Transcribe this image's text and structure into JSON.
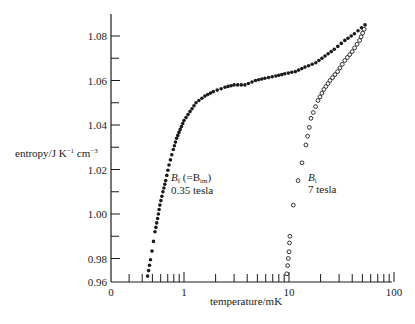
{
  "chart_data": {
    "type": "scatter",
    "title": "",
    "xlabel": "temperature/mK",
    "ylabel": "entropy/J K⁻¹ cm⁻³",
    "x_scale": "log",
    "x_ticks_major": [
      {
        "value": 0.2,
        "label": "0"
      },
      {
        "value": 1,
        "label": "1"
      },
      {
        "value": 10,
        "label": "10"
      },
      {
        "value": 100,
        "label": "100"
      }
    ],
    "x_ticks_minor": [
      0.3,
      0.4,
      0.5,
      0.6,
      0.7,
      0.8,
      0.9,
      2,
      3,
      4,
      5,
      6,
      7,
      8,
      9,
      20,
      30,
      40,
      50,
      60,
      70,
      80,
      90
    ],
    "y_ticks_major": [
      "0.96",
      "0.98",
      "1.00",
      "1.02",
      "1.04",
      "1.06",
      "1.08"
    ],
    "y_ticks_minor": [
      0.99,
      1.01,
      1.03,
      1.05,
      1.07
    ],
    "ylim": [
      0.96,
      1.09
    ],
    "xlim": [
      0.2,
      100
    ],
    "grid": false,
    "legend": "none",
    "series": [
      {
        "name": "B_f (=B_im) 0.35 tesla",
        "marker": "filled-circle",
        "x": [
          0.45,
          0.48,
          0.53,
          0.56,
          0.59,
          0.63,
          0.67,
          0.72,
          0.79,
          0.85,
          0.92,
          1.0,
          1.14,
          1.3,
          1.58,
          1.9,
          2.46,
          3.0,
          3.8,
          4.8,
          5.9,
          7.5,
          9.1,
          11.5,
          14.2,
          18,
          22,
          27,
          34,
          42,
          53
        ],
        "y": [
          0.965,
          0.979,
          0.992,
          0.998,
          1.004,
          1.01,
          1.015,
          1.022,
          1.029,
          1.034,
          1.038,
          1.042,
          1.046,
          1.05,
          1.053,
          1.055,
          1.057,
          1.058,
          1.058,
          1.06,
          1.061,
          1.062,
          1.063,
          1.064,
          1.066,
          1.068,
          1.071,
          1.074,
          1.078,
          1.081,
          1.085
        ]
      },
      {
        "name": "B_i 7 tesla",
        "marker": "open-circle",
        "x": [
          9.5,
          9.7,
          9.85,
          10.0,
          10.1,
          10.2,
          11.0,
          12.2,
          13.3,
          14.5,
          16.2,
          18.9,
          21.5,
          24.6,
          29,
          34,
          40,
          47,
          52
        ],
        "y": [
          0.967,
          0.974,
          0.98,
          0.983,
          0.987,
          0.99,
          1.004,
          1.015,
          1.023,
          1.031,
          1.043,
          1.051,
          1.056,
          1.06,
          1.064,
          1.069,
          1.073,
          1.078,
          1.083
        ]
      }
    ],
    "annotations": [
      {
        "text_main": "B",
        "text_sub": "f",
        "text_rest": " (=B",
        "text_sub2": "im",
        "text_end": ")",
        "line2": "0.35 tesla"
      },
      {
        "text_main": "B",
        "text_sub": "i",
        "line2": "7 tesla"
      }
    ]
  },
  "labels": {
    "ylabel_main": "entropy/J K",
    "ylabel_sup1": "−1",
    "ylabel_cm": " cm",
    "ylabel_sup2": "−3",
    "xlabel": "temperature/mK",
    "ann_f_B": "B",
    "ann_f_sub": "f",
    "ann_f_paren": " (=B",
    "ann_f_sub2": "im",
    "ann_f_close": ")",
    "ann_f_line2": "0.35 tesla",
    "ann_i_B": "B",
    "ann_i_sub": "i",
    "ann_i_line2": "7 tesla"
  }
}
